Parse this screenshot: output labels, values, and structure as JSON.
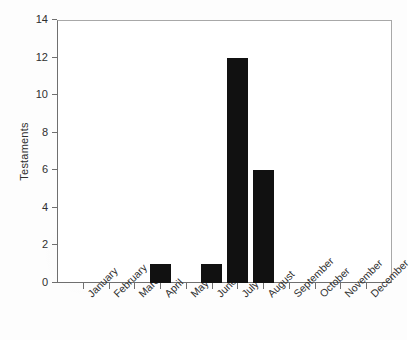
{
  "chart_data": {
    "type": "bar",
    "title": "",
    "subtitle": "",
    "xlabel": "",
    "ylabel": "Testaments",
    "categories": [
      "January",
      "February",
      "March",
      "April",
      "May",
      "June",
      "July",
      "August",
      "September",
      "October",
      "November",
      "December"
    ],
    "values": [
      0,
      0,
      0,
      1,
      0,
      1,
      12,
      6,
      0,
      0,
      0,
      0
    ],
    "series": [
      {
        "name": "Testaments",
        "values": [
          0,
          0,
          0,
          1,
          0,
          1,
          12,
          6,
          0,
          0,
          0,
          0
        ]
      }
    ],
    "ylim": [
      0,
      14
    ],
    "yticks": [
      0,
      2,
      4,
      6,
      8,
      10,
      12,
      14
    ],
    "ytick_labels": [
      "0",
      "2",
      "4",
      "6",
      "8",
      "10",
      "12",
      "14"
    ],
    "xtick_labels": [
      "January",
      "February",
      "March",
      "April",
      "May",
      "June",
      "July",
      "August",
      "September",
      "October",
      "November",
      "December"
    ],
    "xtick_label_rotation": -45,
    "grid": false,
    "legend": false,
    "legend_position": "none",
    "bar_color": "#111111",
    "axis_color": "#6f6f6f",
    "background_color": "#ffffff"
  }
}
